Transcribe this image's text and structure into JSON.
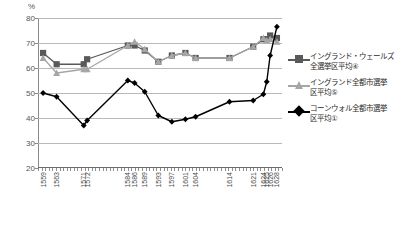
{
  "chart_data": {
    "type": "line",
    "title": "",
    "subtitle": "",
    "xlabel": "",
    "ylabel": "%",
    "ylim": [
      20,
      80
    ],
    "yticks": [
      20,
      30,
      40,
      50,
      60,
      70,
      80
    ],
    "grid": true,
    "legend_position": "right",
    "unit_label": "%",
    "categories": [
      "1559",
      "1563",
      "1571",
      "1572",
      "1584",
      "1586",
      "1589",
      "1593",
      "1597",
      "1601",
      "1604",
      "1614",
      "1621",
      "1624",
      "1625",
      "1626",
      "1628"
    ],
    "series": [
      {
        "name": "イングランド・ウェールズ全選挙区平均④",
        "color": "#595959",
        "marker": "square",
        "values": [
          66.0,
          61.5,
          61.5,
          63.5,
          69.0,
          69.0,
          67.0,
          62.5,
          65.0,
          66.0,
          64.0,
          64.0,
          68.5,
          71.5,
          71.5,
          73.0,
          72.0
        ]
      },
      {
        "name": "イングランド全都市選挙区平均⑤",
        "color": "#a6a6a6",
        "marker": "triangle",
        "values": [
          64.0,
          58.0,
          59.5,
          59.5,
          69.0,
          70.5,
          67.5,
          62.5,
          65.0,
          66.0,
          64.0,
          64.0,
          68.5,
          72.0,
          71.0,
          71.5,
          70.5
        ]
      },
      {
        "name": "コーンウォル全都市選挙区平均①",
        "color": "#000000",
        "marker": "diamond",
        "values": [
          50.0,
          48.5,
          37.0,
          39.0,
          55.0,
          54.0,
          50.5,
          41.0,
          38.5,
          39.5,
          40.5,
          46.5,
          47.0,
          49.5,
          54.5,
          65.0,
          76.5
        ]
      }
    ]
  },
  "legend": {
    "items": [
      {
        "label": "イングランド・ウェールズ\n全選挙区平均④",
        "line1": "イングランド・ウェールズ",
        "line2": "全選挙区平均④",
        "color": "#595959"
      },
      {
        "label": "イングランド全都市選挙\n区平均⑤",
        "line1": "イングランド全都市選挙",
        "line2": "区平均⑤",
        "color": "#a6a6a6"
      },
      {
        "label": "コーンウォル全都市選挙\n区平均①",
        "line1": "コーンウォル全都市選挙",
        "line2": "区平均①",
        "color": "#000000"
      }
    ]
  }
}
